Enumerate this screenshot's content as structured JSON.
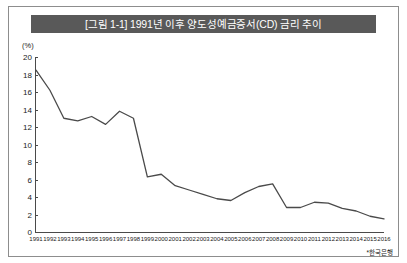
{
  "figure": {
    "title": "[그림 1-1] 1991년 이후 양도성예금증서(CD) 금리 추이",
    "unit_label": "(%)",
    "source_note": "*한국은행",
    "title_bar_color": "#595959",
    "line_color": "#4a4a4a",
    "border_color": "#8d8d8d"
  },
  "chart_data": {
    "type": "line",
    "title": "[그림 1-1] 1991년 이후 양도성예금증서(CD) 금리 추이",
    "xlabel": "",
    "ylabel": "(%)",
    "ylim": [
      0,
      20
    ],
    "ytick_step": 2,
    "grid": false,
    "legend": "none",
    "categories": [
      "1991",
      "1992",
      "1993",
      "1994",
      "1995",
      "1996",
      "1997",
      "1998",
      "1999",
      "2000",
      "2001",
      "2002",
      "2003",
      "2004",
      "2005",
      "2006",
      "2007",
      "2008",
      "2009",
      "2010",
      "2011",
      "2012",
      "2013",
      "2014",
      "2015",
      "2016"
    ],
    "yticks": [
      0,
      2,
      4,
      6,
      8,
      10,
      12,
      14,
      16,
      18,
      20
    ],
    "series": [
      {
        "name": "양도성예금증서(CD) 금리",
        "values": [
          18.5,
          16.2,
          13.0,
          12.7,
          13.2,
          12.3,
          13.8,
          13.0,
          6.3,
          6.6,
          5.3,
          4.8,
          4.3,
          3.8,
          3.6,
          4.5,
          5.2,
          5.5,
          2.8,
          2.8,
          3.4,
          3.3,
          2.7,
          2.4,
          1.8,
          1.5
        ]
      }
    ]
  }
}
